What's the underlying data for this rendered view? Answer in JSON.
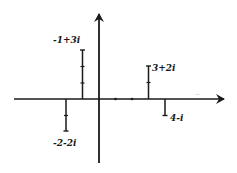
{
  "diagram": {
    "colors": {
      "ink": "#1a1a1a",
      "background": "#ffffff"
    },
    "axes": {
      "origin_px": [
        99,
        99
      ],
      "unit_px": 16.5,
      "x_axis": {
        "from_px": 14,
        "to_px": 225,
        "arrow": "right"
      },
      "y_axis": {
        "from_px": 163,
        "to_px": 12,
        "arrow": "up"
      },
      "x_ticks": [
        1,
        2
      ]
    },
    "points": [
      {
        "label": "-1+3i",
        "re": -1,
        "im": 3
      },
      {
        "label": "3+2i",
        "re": 3,
        "im": 2
      },
      {
        "label": "-2-2i",
        "re": -2,
        "im": -2
      },
      {
        "label": "4-i",
        "re": 4,
        "im": -1
      }
    ],
    "stray_mark": ".."
  }
}
